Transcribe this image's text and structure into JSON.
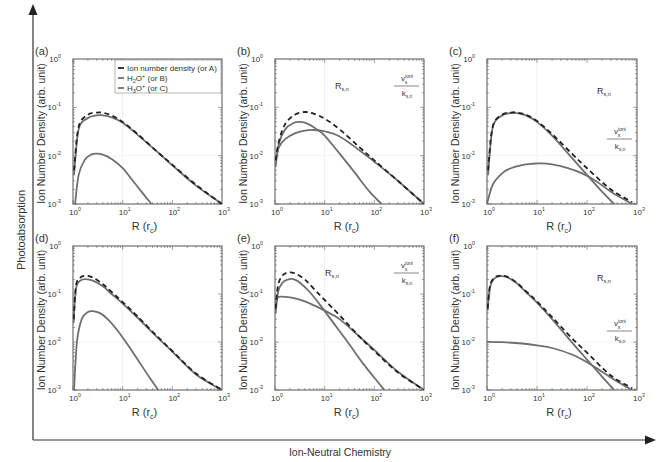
{
  "figure": {
    "outer_axis_x_label": "Ion-Neutral Chemistry",
    "outer_axis_y_label": "Photoabsorption",
    "colors": {
      "solid": "#6f6f6f",
      "dashed": "#222222",
      "frame": "#555555",
      "text": "#333333"
    }
  },
  "chart_data": [
    {
      "panel": "(a)",
      "type": "line",
      "xlabel": "R (r_c)",
      "ylabel": "Ion Number Density (arb. unit)",
      "xscale": "log",
      "yscale": "log",
      "xlim": [
        1,
        1000
      ],
      "ylim": [
        0.001,
        1
      ],
      "xticks": [
        "10^0",
        "10^1",
        "10^2",
        "10^3"
      ],
      "yticks": [
        "10^-3",
        "10^-2",
        "10^-1",
        "10^0"
      ],
      "legend": [
        "Ion number density (or A)",
        "H2O+ (or B)",
        "H3O+ (or C)"
      ],
      "annotations": [],
      "series": [
        {
          "name": "Ion number density (or A)",
          "style": "dashed",
          "x": [
            1.05,
            1.3,
            2,
            3,
            4,
            6,
            10,
            20,
            50,
            100,
            300,
            1000
          ],
          "y": [
            0.005,
            0.04,
            0.07,
            0.078,
            0.077,
            0.068,
            0.05,
            0.028,
            0.012,
            0.0065,
            0.0025,
            0.001
          ]
        },
        {
          "name": "H2O+ (or B)",
          "style": "solid",
          "x": [
            1.05,
            1.3,
            2,
            3,
            4,
            6,
            10,
            20,
            50,
            100,
            300,
            1000
          ],
          "y": [
            0.004,
            0.035,
            0.06,
            0.068,
            0.068,
            0.062,
            0.048,
            0.027,
            0.012,
            0.0063,
            0.0024,
            0.001
          ]
        },
        {
          "name": "H3O+ (or C)",
          "style": "solid",
          "x": [
            1.1,
            1.3,
            1.7,
            2.3,
            3,
            4,
            6,
            10,
            15,
            25,
            38
          ],
          "y": [
            0.001,
            0.004,
            0.008,
            0.0105,
            0.011,
            0.0105,
            0.0085,
            0.0055,
            0.0033,
            0.0017,
            0.001
          ]
        }
      ]
    },
    {
      "panel": "(b)",
      "type": "line",
      "xlabel": "R (r_c)",
      "ylabel": "Ion Number Density (arb. unit)",
      "xscale": "log",
      "yscale": "log",
      "xlim": [
        1,
        1000
      ],
      "ylim": [
        0.001,
        1
      ],
      "xticks": [
        "10^0",
        "10^1",
        "10^2",
        "10^3"
      ],
      "yticks": [
        "10^-3",
        "10^-2",
        "10^-1",
        "10^0"
      ],
      "annotations": [
        "R_s,n",
        "v_s^ioni / k_s,n"
      ],
      "series": [
        {
          "name": "Ion number density",
          "style": "dashed",
          "x": [
            1.03,
            1.2,
            1.6,
            2.5,
            4,
            6,
            10,
            20,
            50,
            100,
            300,
            1000
          ],
          "y": [
            0.008,
            0.02,
            0.045,
            0.07,
            0.08,
            0.074,
            0.058,
            0.035,
            0.015,
            0.008,
            0.003,
            0.001
          ]
        },
        {
          "name": "H2O+",
          "style": "solid",
          "x": [
            1.03,
            1.2,
            1.6,
            2.3,
            3.2,
            4.5,
            7,
            10,
            20,
            40,
            80,
            140
          ],
          "y": [
            0.006,
            0.018,
            0.035,
            0.047,
            0.05,
            0.046,
            0.035,
            0.026,
            0.011,
            0.0045,
            0.0018,
            0.001
          ]
        },
        {
          "name": "H3O+",
          "style": "solid",
          "x": [
            1.03,
            1.2,
            1.6,
            2.5,
            4,
            6,
            10,
            20,
            50,
            100,
            300,
            1000
          ],
          "y": [
            0.008,
            0.015,
            0.022,
            0.029,
            0.033,
            0.034,
            0.032,
            0.025,
            0.013,
            0.0075,
            0.003,
            0.001
          ]
        }
      ]
    },
    {
      "panel": "(c)",
      "type": "line",
      "xlabel": "R (r_c)",
      "ylabel": "Ion Number Density (arb. unit)",
      "xscale": "log",
      "yscale": "log",
      "xlim": [
        1,
        1000
      ],
      "ylim": [
        0.001,
        1
      ],
      "xticks": [
        "10^0",
        "10^1",
        "10^2",
        "10^3"
      ],
      "yticks": [
        "10^-3",
        "10^-2",
        "10^-1",
        "10^0"
      ],
      "annotations": [
        "R_s,n",
        "v_s^ioni / k_s,n"
      ],
      "series": [
        {
          "name": "Ion number density",
          "style": "dashed",
          "x": [
            1.05,
            1.3,
            2,
            3,
            4,
            6,
            10,
            20,
            50,
            100,
            300,
            800
          ],
          "y": [
            0.005,
            0.04,
            0.07,
            0.078,
            0.078,
            0.07,
            0.052,
            0.028,
            0.011,
            0.0055,
            0.002,
            0.0011
          ]
        },
        {
          "name": "H2O+",
          "style": "solid",
          "x": [
            1.05,
            1.3,
            2,
            3,
            4,
            6,
            10,
            20,
            50,
            100,
            200,
            350
          ],
          "y": [
            0.004,
            0.038,
            0.068,
            0.076,
            0.076,
            0.068,
            0.05,
            0.026,
            0.009,
            0.004,
            0.0018,
            0.001
          ]
        },
        {
          "name": "H3O+",
          "style": "solid",
          "x": [
            1,
            1.3,
            2,
            3,
            5,
            8,
            12,
            20,
            40,
            80,
            150,
            300,
            800
          ],
          "y": [
            0.001,
            0.0025,
            0.0043,
            0.0055,
            0.0064,
            0.0068,
            0.0069,
            0.0066,
            0.0056,
            0.0043,
            0.003,
            0.0018,
            0.001
          ]
        }
      ]
    },
    {
      "panel": "(d)",
      "type": "line",
      "xlabel": "R (r_c)",
      "ylabel": "Ion Number Density (arb. unit)",
      "xscale": "log",
      "yscale": "log",
      "xlim": [
        1,
        1000
      ],
      "ylim": [
        0.001,
        1
      ],
      "xticks": [
        "10^0",
        "10^1",
        "10^2",
        "10^3"
      ],
      "yticks": [
        "10^-3",
        "10^-2",
        "10^-1",
        "10^0"
      ],
      "annotations": [],
      "series": [
        {
          "name": "Ion number density",
          "style": "dashed",
          "x": [
            1.03,
            1.15,
            1.4,
            1.8,
            2.5,
            4,
            6,
            10,
            20,
            50,
            100,
            300,
            1000
          ],
          "y": [
            0.03,
            0.15,
            0.22,
            0.24,
            0.22,
            0.16,
            0.11,
            0.068,
            0.034,
            0.013,
            0.0065,
            0.0022,
            0.001
          ]
        },
        {
          "name": "H2O+",
          "style": "solid",
          "x": [
            1.03,
            1.15,
            1.4,
            1.8,
            2.5,
            4,
            6,
            10,
            20,
            50,
            100,
            300,
            1000
          ],
          "y": [
            0.025,
            0.13,
            0.19,
            0.205,
            0.19,
            0.145,
            0.1,
            0.063,
            0.032,
            0.0125,
            0.0063,
            0.0021,
            0.001
          ]
        },
        {
          "name": "H3O+",
          "style": "solid",
          "x": [
            1.05,
            1.2,
            1.5,
            2,
            2.5,
            3.5,
            5,
            8,
            12,
            20,
            35,
            52
          ],
          "y": [
            0.001,
            0.01,
            0.03,
            0.042,
            0.044,
            0.04,
            0.03,
            0.017,
            0.0095,
            0.0043,
            0.0018,
            0.001
          ]
        }
      ]
    },
    {
      "panel": "(e)",
      "type": "line",
      "xlabel": "R (r_c)",
      "ylabel": "Ion Number Density (arb. unit)",
      "xscale": "log",
      "yscale": "log",
      "xlim": [
        1,
        1000
      ],
      "ylim": [
        0.001,
        1
      ],
      "xticks": [
        "10^0",
        "10^1",
        "10^2",
        "10^3"
      ],
      "yticks": [
        "10^-3",
        "10^-2",
        "10^-1",
        "10^0"
      ],
      "annotations": [
        "R_s,n",
        "v_s^ioni / k_s,n"
      ],
      "series": [
        {
          "name": "Ion number density",
          "style": "dashed",
          "x": [
            1.03,
            1.15,
            1.4,
            1.8,
            2.5,
            4,
            6,
            10,
            20,
            50,
            100,
            300,
            1000
          ],
          "y": [
            0.05,
            0.15,
            0.24,
            0.28,
            0.27,
            0.2,
            0.13,
            0.075,
            0.036,
            0.013,
            0.0065,
            0.0023,
            0.001
          ]
        },
        {
          "name": "H2O+",
          "style": "solid",
          "x": [
            1.03,
            1.15,
            1.4,
            1.8,
            2.3,
            3,
            5,
            8,
            15,
            30,
            60,
            100,
            160
          ],
          "y": [
            0.04,
            0.11,
            0.17,
            0.2,
            0.205,
            0.18,
            0.11,
            0.06,
            0.025,
            0.0095,
            0.0035,
            0.0018,
            0.001
          ]
        },
        {
          "name": "H3O+",
          "style": "solid",
          "x": [
            1.03,
            1.1,
            1.3,
            2,
            3,
            5,
            10,
            20,
            50,
            100,
            300,
            1000
          ],
          "y": [
            0.05,
            0.08,
            0.088,
            0.085,
            0.077,
            0.064,
            0.045,
            0.03,
            0.013,
            0.0068,
            0.0024,
            0.001
          ]
        }
      ]
    },
    {
      "panel": "(f)",
      "type": "line",
      "xlabel": "R (r_c)",
      "ylabel": "Ion Number Density (arb. unit)",
      "xscale": "log",
      "yscale": "log",
      "xlim": [
        1,
        1000
      ],
      "ylim": [
        0.001,
        1
      ],
      "xticks": [
        "10^0",
        "10^1",
        "10^2",
        "10^3"
      ],
      "yticks": [
        "10^-3",
        "10^-2",
        "10^-1",
        "10^0"
      ],
      "annotations": [
        "R_s,n",
        "v_s^ioni / k_s,n"
      ],
      "series": [
        {
          "name": "Ion number density",
          "style": "dashed",
          "x": [
            1.03,
            1.15,
            1.4,
            1.8,
            2.5,
            4,
            6,
            10,
            20,
            50,
            100,
            300,
            800
          ],
          "y": [
            0.05,
            0.15,
            0.22,
            0.24,
            0.23,
            0.17,
            0.115,
            0.07,
            0.033,
            0.012,
            0.006,
            0.002,
            0.0011
          ]
        },
        {
          "name": "H2O+",
          "style": "solid",
          "x": [
            1.03,
            1.15,
            1.4,
            1.8,
            2.5,
            4,
            6,
            10,
            20,
            50,
            100,
            200,
            350
          ],
          "y": [
            0.045,
            0.14,
            0.21,
            0.235,
            0.225,
            0.165,
            0.11,
            0.066,
            0.03,
            0.0098,
            0.0043,
            0.0019,
            0.001
          ]
        },
        {
          "name": "H3O+",
          "style": "solid",
          "x": [
            1,
            2,
            5,
            10,
            20,
            50,
            100,
            200,
            400,
            800
          ],
          "y": [
            0.0101,
            0.0099,
            0.0093,
            0.0085,
            0.0075,
            0.0055,
            0.0038,
            0.0024,
            0.0015,
            0.001
          ]
        }
      ]
    }
  ]
}
